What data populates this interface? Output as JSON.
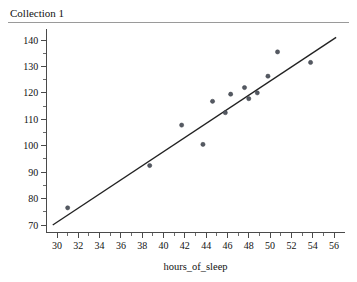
{
  "window": {
    "collection_title": "Collection 1"
  },
  "chart_data": {
    "type": "scatter",
    "title": "Collection 1",
    "xlabel": "hours_of_sleep",
    "ylabel": "",
    "xlim": [
      29,
      57
    ],
    "ylim": [
      67,
      144
    ],
    "grid": false,
    "legend": null,
    "x_ticks": [
      30,
      32,
      34,
      36,
      38,
      40,
      42,
      44,
      46,
      48,
      50,
      52,
      54,
      56
    ],
    "x_tick_labels": [
      "30",
      "32",
      "34",
      "36",
      "38",
      "40",
      "42",
      "44",
      "46",
      "48",
      "50",
      "52",
      "54",
      "56"
    ],
    "x_minor_step": 1,
    "y_ticks": [
      70,
      80,
      90,
      100,
      110,
      120,
      130,
      140
    ],
    "y_tick_labels": [
      "70",
      "80",
      "90",
      "100",
      "110",
      "120",
      "130",
      "140"
    ],
    "y_minor_step": 5,
    "points": [
      {
        "x": 31.0,
        "y": 76.5
      },
      {
        "x": 38.7,
        "y": 92.5
      },
      {
        "x": 41.7,
        "y": 107.8
      },
      {
        "x": 43.7,
        "y": 100.5
      },
      {
        "x": 44.6,
        "y": 116.8
      },
      {
        "x": 45.8,
        "y": 112.5
      },
      {
        "x": 46.3,
        "y": 119.5
      },
      {
        "x": 47.6,
        "y": 122.0
      },
      {
        "x": 48.0,
        "y": 117.8
      },
      {
        "x": 48.8,
        "y": 120.0
      },
      {
        "x": 49.8,
        "y": 126.3
      },
      {
        "x": 50.7,
        "y": 135.5
      },
      {
        "x": 53.8,
        "y": 131.5
      }
    ],
    "fit_line": {
      "type": "least-squares",
      "x_start": 29.6,
      "y_start": 70.0,
      "x_end": 56.2,
      "y_end": 141.0
    }
  }
}
